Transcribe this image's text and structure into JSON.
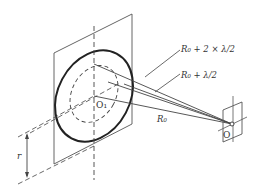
{
  "diagram": {
    "labels": {
      "r2": "R₀ + 2 × λ/2",
      "r1": "R₀ + λ/2",
      "r0": "R₀",
      "center_large": "O₁",
      "center_small": "O",
      "radius": "r"
    },
    "colors": {
      "stroke": "#444444",
      "text": "#333333",
      "background": "#ffffff"
    }
  }
}
